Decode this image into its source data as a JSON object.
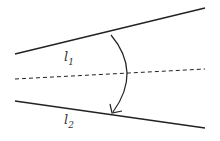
{
  "diagram": {
    "type": "angle-bisector",
    "labels": {
      "l1": {
        "base": "l",
        "sub": "1"
      },
      "l2": {
        "base": "l",
        "sub": "2"
      }
    },
    "lines": {
      "l1": {
        "x1": 15,
        "y1": 54,
        "x2": 205,
        "y2": 8,
        "style": "solid"
      },
      "bisector": {
        "x1": 15,
        "y1": 79,
        "x2": 205,
        "y2": 69,
        "style": "dashed"
      },
      "l2": {
        "x1": 15,
        "y1": 101,
        "x2": 205,
        "y2": 128,
        "style": "solid"
      }
    },
    "arc": {
      "from": [
        111,
        34
      ],
      "to": [
        112,
        113
      ],
      "direction": "clockwise",
      "arrowhead": "end"
    },
    "stroke_color": "#222222"
  }
}
